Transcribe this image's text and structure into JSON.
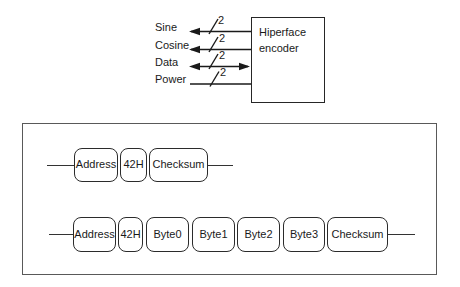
{
  "encoder": {
    "label": "Hiperface encoder"
  },
  "signals": {
    "items": [
      {
        "label": "Sine",
        "bus": "2",
        "direction": "out"
      },
      {
        "label": "Cosine",
        "bus": "2",
        "direction": "out"
      },
      {
        "label": "Data",
        "bus": "2",
        "direction": "bidirectional"
      },
      {
        "label": "Power",
        "bus": "2",
        "direction": "in"
      }
    ]
  },
  "frames": [
    {
      "fields": [
        "Address",
        "42H",
        "Checksum"
      ]
    },
    {
      "fields": [
        "Address",
        "42H",
        "Byte0",
        "Byte1",
        "Byte2",
        "Byte3",
        "Checksum"
      ]
    }
  ],
  "colors": {
    "background": "#ffffff",
    "line": "#1a1a1a",
    "box_border": "#2b2b2b",
    "panel_border": "#595959",
    "text": "#1a1a1a"
  }
}
